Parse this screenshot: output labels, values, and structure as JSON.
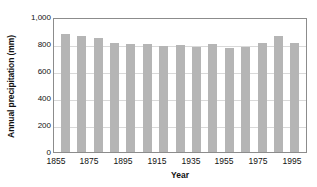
{
  "chart_data": {
    "type": "bar",
    "title": "",
    "subtitle": "",
    "xlabel": "Year",
    "ylabel": "Annual precipitation (mm)",
    "categories": [
      1855,
      1865,
      1875,
      1885,
      1895,
      1905,
      1915,
      1925,
      1935,
      1945,
      1955,
      1965,
      1975,
      1985,
      1995
    ],
    "values": [
      890,
      870,
      855,
      820,
      810,
      810,
      800,
      808,
      790,
      815,
      783,
      793,
      820,
      870,
      820
    ],
    "series": [
      {
        "name": "Annual precipitation",
        "values": [
          890,
          870,
          855,
          820,
          810,
          810,
          800,
          808,
          790,
          815,
          783,
          793,
          820,
          870,
          820
        ]
      }
    ],
    "ylim": [
      0,
      1000
    ],
    "yticks": [
      0,
      200,
      400,
      600,
      800,
      1000
    ],
    "ytick_labels": [
      "0",
      "200",
      "400",
      "600",
      "800",
      "1,000"
    ],
    "xtick_labels": [
      "1855",
      "1875",
      "1895",
      "1915",
      "1935",
      "1955",
      "1975",
      "1995"
    ],
    "xticks": [
      1855,
      1875,
      1895,
      1915,
      1935,
      1955,
      1975,
      1995
    ],
    "grid": true,
    "grid_axis": "y",
    "legend": false,
    "legend_position": "none",
    "annotations": [],
    "colors": {
      "bar_fill": "#b5b5b5",
      "gridline": "#d9d9d9",
      "axis_border": "#8c8c8c",
      "text": "#111111",
      "background": "#ffffff"
    }
  }
}
